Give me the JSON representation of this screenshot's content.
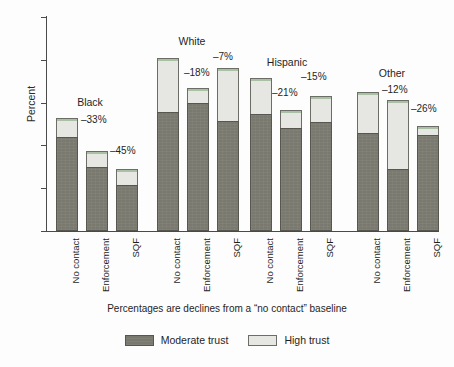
{
  "chart_data": {
    "type": "bar",
    "subtype": "stacked-grouped",
    "title": "",
    "xlabel": "Percentages are declines from a \"no contact\" baseline",
    "ylabel": "Percent",
    "ylim": [
      0,
      100
    ],
    "yticks": [
      0,
      20,
      40,
      60,
      80,
      100
    ],
    "grid": false,
    "legend_position": "bottom",
    "categories": [
      "No contact",
      "Enforcement",
      "SQF"
    ],
    "groups": [
      {
        "name": "Black",
        "bars": [
          {
            "category": "No contact",
            "moderate_trust": 44.0,
            "high_trust": 9.0,
            "total": 53.0,
            "decline_label": ""
          },
          {
            "category": "Enforcement",
            "moderate_trust": 30.0,
            "high_trust": 7.5,
            "total": 37.5,
            "decline_label": "–33%"
          },
          {
            "category": "SQF",
            "moderate_trust": 21.5,
            "high_trust": 7.5,
            "total": 29.0,
            "decline_label": "–45%"
          }
        ]
      },
      {
        "name": "White",
        "bars": [
          {
            "category": "No contact",
            "moderate_trust": 55.5,
            "high_trust": 25.5,
            "total": 81.0,
            "decline_label": ""
          },
          {
            "category": "Enforcement",
            "moderate_trust": 60.0,
            "high_trust": 7.0,
            "total": 67.0,
            "decline_label": "–18%"
          },
          {
            "category": "SQF",
            "moderate_trust": 51.5,
            "high_trust": 24.5,
            "total": 76.0,
            "decline_label": "–7%"
          }
        ]
      },
      {
        "name": "Hispanic",
        "bars": [
          {
            "category": "No contact",
            "moderate_trust": 54.5,
            "high_trust": 17.0,
            "total": 71.5,
            "decline_label": ""
          },
          {
            "category": "Enforcement",
            "moderate_trust": 48.0,
            "high_trust": 8.5,
            "total": 56.5,
            "decline_label": "–21%"
          },
          {
            "category": "SQF",
            "moderate_trust": 51.0,
            "high_trust": 12.0,
            "total": 63.0,
            "decline_label": "–15%"
          }
        ]
      },
      {
        "name": "Other",
        "bars": [
          {
            "category": "No contact",
            "moderate_trust": 46.0,
            "high_trust": 19.0,
            "total": 65.0,
            "decline_label": ""
          },
          {
            "category": "Enforcement",
            "moderate_trust": 29.0,
            "high_trust": 32.0,
            "total": 61.0,
            "decline_label": "–12%"
          },
          {
            "category": "SQF",
            "moderate_trust": 45.0,
            "high_trust": 4.0,
            "total": 49.0,
            "decline_label": "–26%"
          }
        ]
      }
    ],
    "series": [
      {
        "name": "Moderate trust",
        "color": "#79796f"
      },
      {
        "name": "High trust",
        "color": "#e6e6e2"
      }
    ]
  },
  "axes": {
    "y_title": "Percent",
    "y_tick_labels": [
      "100",
      "80",
      "60",
      "40",
      "20",
      "0"
    ],
    "x_tick_labels": [
      "No contact",
      "Enforcement",
      "SQF",
      "No contact",
      "Enforcement",
      "SQF",
      "No contact",
      "Enforcement",
      "SQF",
      "No contact",
      "Enforcement",
      "SQF"
    ]
  },
  "group_labels": [
    "Black",
    "White",
    "Hispanic",
    "Other"
  ],
  "pct_labels": [
    "–33%",
    "–45%",
    "–18%",
    "–7%",
    "–21%",
    "–15%",
    "–12%",
    "–26%"
  ],
  "caption": "Percentages are declines from a “no contact” baseline",
  "legend": {
    "items": [
      {
        "label": "Moderate trust",
        "color": "#79796f"
      },
      {
        "label": "High trust",
        "color": "#e6e6e2"
      }
    ]
  }
}
